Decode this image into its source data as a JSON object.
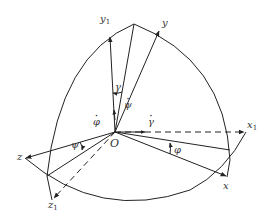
{
  "figure": {
    "type": "euler-angle-coordinate-frames",
    "origin_label": "O",
    "axes": [
      {
        "name": "x1",
        "label": "x",
        "subscript": "1",
        "style": "dashed"
      },
      {
        "name": "y1",
        "label": "y",
        "subscript": "1",
        "style": "solid"
      },
      {
        "name": "z1",
        "label": "z",
        "subscript": "1",
        "style": "dashed"
      },
      {
        "name": "x",
        "label": "x",
        "subscript": "",
        "style": "solid"
      },
      {
        "name": "y",
        "label": "y",
        "subscript": "",
        "style": "solid"
      },
      {
        "name": "z",
        "label": "z",
        "subscript": "",
        "style": "solid"
      }
    ],
    "angles": [
      {
        "name": "gamma",
        "label": "γ"
      },
      {
        "name": "psi",
        "label": "ψ"
      },
      {
        "name": "phi",
        "label": "φ"
      }
    ],
    "rates": [
      {
        "name": "psi-dot",
        "label": "ψ"
      },
      {
        "name": "gamma-dot",
        "label": "γ"
      },
      {
        "name": "phi-dot",
        "label": "φ"
      }
    ],
    "stroke_color": "#222222",
    "label_color": "#333333"
  }
}
